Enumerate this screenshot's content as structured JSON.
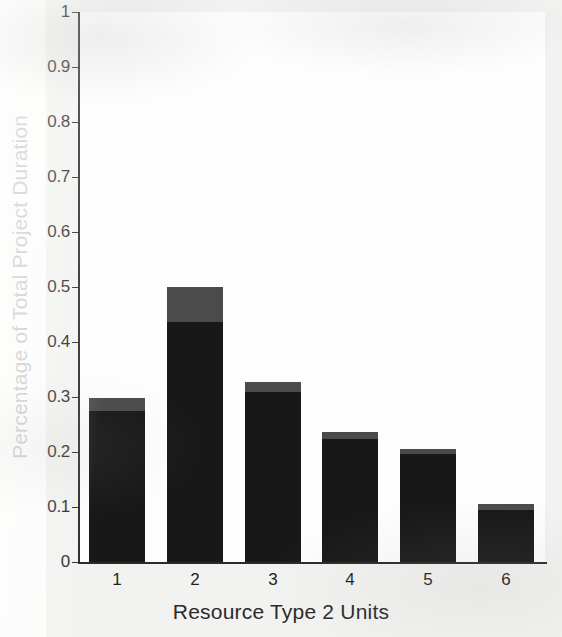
{
  "chart_data": {
    "type": "bar",
    "title": "",
    "subtitle": "",
    "xlabel": "Resource Type 2 Units",
    "ylabel": "Percentage of Total Project Duration",
    "categories": [
      "1",
      "2",
      "3",
      "4",
      "5",
      "6"
    ],
    "xlim": [
      0.5,
      6.5
    ],
    "ylim": [
      0,
      1
    ],
    "ytick_labels": [
      "0",
      "0.1",
      "0.2",
      "0.3",
      "0.4",
      "0.5",
      "0.6",
      "0.7",
      "0.8",
      "0.9",
      "1"
    ],
    "ytick_values": [
      0,
      0.1,
      0.2,
      0.3,
      0.4,
      0.5,
      0.6,
      0.7,
      0.8,
      0.9,
      1
    ],
    "grid": false,
    "legend": null,
    "stacked": true,
    "series": [
      {
        "name": "lower-segment",
        "color": "#181818",
        "values": [
          0.275,
          0.436,
          0.309,
          0.224,
          0.196,
          0.094
        ]
      },
      {
        "name": "upper-segment",
        "color": "#4b4b4b",
        "values": [
          0.024,
          0.064,
          0.018,
          0.012,
          0.009,
          0.011
        ]
      }
    ],
    "totals": [
      0.299,
      0.5,
      0.327,
      0.236,
      0.205,
      0.105
    ]
  },
  "colors": {
    "bar_dark": "#181818",
    "bar_gray": "#4b4b4b",
    "axis": "#2a2a2a",
    "text": "#1f1f1f",
    "page_background": "#f2f2f0",
    "plot_background": "#fdfdfd"
  }
}
